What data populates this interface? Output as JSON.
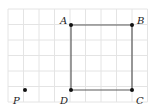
{
  "diagram": {
    "type": "geometry-grid",
    "grid": {
      "origin_px": [
        8,
        9
      ],
      "cell_px": 15.5,
      "cols": 9,
      "rows": 6,
      "color": "#e4e4e4"
    },
    "square": {
      "vertices": [
        "A",
        "B",
        "C",
        "D"
      ],
      "stroke": "#5a5a5a"
    },
    "points": [
      {
        "label": "A",
        "grid": [
          4,
          1
        ],
        "px": [
          71,
          25
        ],
        "label_px": [
          60,
          24
        ]
      },
      {
        "label": "B",
        "grid": [
          8,
          1
        ],
        "px": [
          132,
          25
        ],
        "label_px": [
          137,
          24
        ]
      },
      {
        "label": "C",
        "grid": [
          8,
          5
        ],
        "px": [
          132,
          90
        ],
        "label_px": [
          136,
          104
        ]
      },
      {
        "label": "D",
        "grid": [
          4,
          5
        ],
        "px": [
          71,
          90
        ],
        "label_px": [
          60,
          104
        ]
      },
      {
        "label": "P",
        "grid": [
          1,
          5
        ],
        "px": [
          25,
          90
        ],
        "label_px": [
          13,
          104
        ]
      }
    ]
  }
}
